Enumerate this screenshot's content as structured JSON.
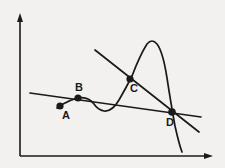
{
  "figure": {
    "background_color": "#f2f1ef",
    "ink_color": "#1a1a1a",
    "axes": {
      "y_axis": {
        "name": "vertical-axis",
        "x": 20,
        "y_top": 14,
        "y_bottom": 156,
        "arrow": "up"
      },
      "x_axis": {
        "name": "horizontal-axis",
        "y": 156,
        "x_left": 20,
        "x_right": 212,
        "arrow": "right"
      }
    },
    "points": [
      {
        "label": "A",
        "x": 60,
        "y": 106,
        "label_x": 66,
        "label_y": 119,
        "radius": 3.6
      },
      {
        "label": "B",
        "x": 78,
        "y": 98,
        "label_x": 79,
        "label_y": 91,
        "radius": 3.6
      },
      {
        "label": "C",
        "x": 130,
        "y": 79,
        "label_x": 134,
        "label_y": 92,
        "radius": 3.6
      },
      {
        "label": "D",
        "x": 172,
        "y": 112,
        "label_x": 170,
        "label_y": 126,
        "radius": 3.8
      }
    ],
    "curve": {
      "name": "cubic-curve",
      "path": "M 57 108 L 63 104 Q 70 100 78 98 Q 88 96 94 104 Q 98 110 104 111 Q 112 112 119 100 Q 126 88 132 76 Q 140 55 147 44 Q 152 38 157 44 Q 163 52 167 78 Q 171 104 175 126 Q 179 144 182 152",
      "stroke_width": 1.6
    },
    "lines": [
      {
        "name": "secant-line-AB-D",
        "description": "shallow line through A, B and D",
        "x1": 30,
        "y1": 93,
        "x2": 201,
        "y2": 117,
        "stroke_width": 1.6
      },
      {
        "name": "secant-line-C-D",
        "description": "steep descending line through C and D",
        "x1": 95,
        "y1": 50,
        "x2": 199,
        "y2": 132,
        "stroke_width": 1.6
      }
    ]
  }
}
